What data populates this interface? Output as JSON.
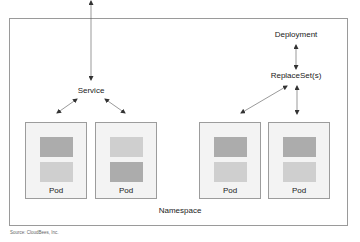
{
  "diagram": {
    "namespace_label": "Namespace",
    "service_label": "Service",
    "deployment_label": "Deployment",
    "replicaset_label": "ReplaceSet(s)",
    "pods": [
      {
        "label": "Pod",
        "container_top_color": "#acacac",
        "container_bottom_color": "#cfcfcf"
      },
      {
        "label": "Pod",
        "container_top_color": "#cfcfcf",
        "container_bottom_color": "#acacac"
      },
      {
        "label": "Pod",
        "container_top_color": "#acacac",
        "container_bottom_color": "#cfcfcf"
      },
      {
        "label": "Pod",
        "container_top_color": "#acacac",
        "container_bottom_color": "#cfcfcf"
      }
    ],
    "source": "Source: CloudBees, Inc."
  },
  "colors": {
    "border": "#9a9a9a",
    "pod_background": "#f3f3f3",
    "arrow": "#333333"
  }
}
